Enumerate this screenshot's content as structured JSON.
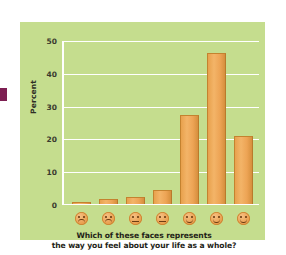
{
  "figure": {
    "panel_background": "#c5dd8e",
    "page_background": "#ffffff",
    "edge_mark_color": "#7d1f52",
    "bar_color": "#eba355",
    "gridline_color": "#ffffff",
    "caption_line1": "Which of these faces represents",
    "caption_line2": "the way you feel about your life as a whole?"
  },
  "axis": {
    "ylabel": "Percent",
    "ticks": [
      "0",
      "10",
      "20",
      "30",
      "40",
      "50"
    ]
  },
  "faces": [
    {
      "name": "face-very-sad",
      "mood": "frown"
    },
    {
      "name": "face-sad",
      "mood": "frown"
    },
    {
      "name": "face-slightly-sad",
      "mood": "flat"
    },
    {
      "name": "face-neutral",
      "mood": "flat"
    },
    {
      "name": "face-slightly-happy",
      "mood": "smile"
    },
    {
      "name": "face-happy",
      "mood": "smile"
    },
    {
      "name": "face-very-happy",
      "mood": "smile"
    }
  ],
  "chart_data": {
    "type": "bar",
    "title": "",
    "xlabel": "Which of these faces represents the way you feel about your life as a whole?",
    "ylabel": "Percent",
    "categories": [
      "Face 1",
      "Face 2",
      "Face 3",
      "Face 4",
      "Face 5",
      "Face 6",
      "Face 7"
    ],
    "category_icons": [
      "very sad",
      "sad",
      "slightly sad",
      "neutral",
      "slightly happy",
      "happy",
      "very happy"
    ],
    "values": [
      0.2,
      1.3,
      2.1,
      4.2,
      27,
      46,
      20.5
    ],
    "ylim": [
      0,
      50
    ],
    "yticks": [
      0,
      10,
      20,
      30,
      40,
      50
    ],
    "grid": true,
    "legend": "none",
    "bar_color": "#eba355"
  }
}
